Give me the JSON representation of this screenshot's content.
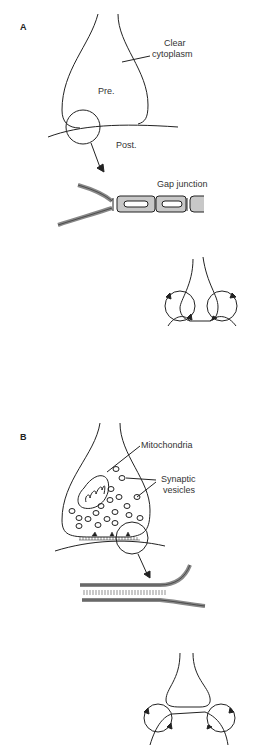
{
  "panels": {
    "a": {
      "letter": "A",
      "labels": {
        "clear_cytoplasm_1": "Clear",
        "clear_cytoplasm_2": "cytoplasm",
        "pre": "Pre.",
        "post": "Post.",
        "gap_junction": "Gap junction"
      }
    },
    "b": {
      "letter": "B",
      "labels": {
        "mitochondria": "Mitochondria",
        "synaptic_vesicles_1": "Synaptic",
        "synaptic_vesicles_2": "vesicles"
      }
    }
  },
  "colors": {
    "line": "#222222",
    "membrane_fill": "#bbbbbb"
  }
}
